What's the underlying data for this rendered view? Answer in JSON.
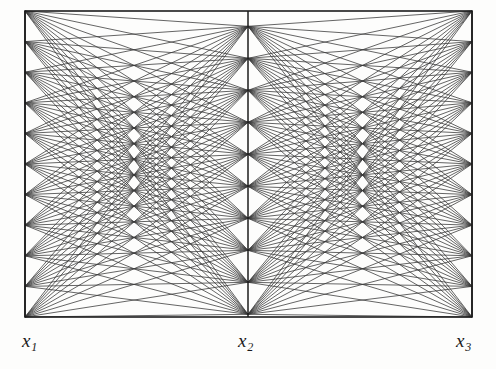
{
  "figure": {
    "kind": "parallel-coordinates-bipartite-line-figure",
    "background_color": "#fdfdfc",
    "line_color": "#3a3a3a",
    "frame_color": "#1c1c1c",
    "axis_color": "#1c1c1c"
  },
  "axes": [
    {
      "id": "x1",
      "label": "x",
      "subscript": "1",
      "x": 25,
      "label_x": 22,
      "label_y": 331,
      "node_count": 11
    },
    {
      "id": "x2",
      "label": "x",
      "subscript": "2",
      "x": 248,
      "label_x": 238,
      "label_y": 331,
      "node_count": 10
    },
    {
      "id": "x3",
      "label": "x",
      "subscript": "3",
      "x": 472,
      "label_x": 456,
      "label_y": 331,
      "node_count": 11
    }
  ],
  "frame": {
    "left": 25,
    "right": 472,
    "top": 11,
    "bottom": 317,
    "stroke_width": 1.6
  },
  "chart_data": {
    "type": "line",
    "title": "",
    "subtitle": "",
    "xlabel": "",
    "ylabel": "",
    "grid": false,
    "legend": "none",
    "axis_names": [
      "x1",
      "x2",
      "x3"
    ],
    "axis_tick_labels": [
      [],
      [],
      []
    ],
    "xlim": [
      25,
      472
    ],
    "ylim": [
      11,
      317
    ],
    "node_positions": {
      "x1": [
        11,
        41.6,
        72.2,
        102.8,
        133.4,
        164,
        194.6,
        225.2,
        255.8,
        286.4,
        317
      ],
      "x2": [
        26.3,
        58.3,
        90.3,
        122.3,
        154.3,
        186.3,
        218.3,
        250.3,
        282.3,
        314.3
      ],
      "x3": [
        11,
        41.6,
        72.2,
        102.8,
        133.4,
        164,
        194.6,
        225.2,
        255.8,
        286.4,
        317
      ]
    },
    "series": [
      {
        "name": "x1-to-x2 bundle",
        "from_axis": "x1",
        "to_axis": "x2",
        "segment_count": 110
      },
      {
        "name": "x2-to-x3 bundle",
        "from_axis": "x2",
        "to_axis": "x3",
        "segment_count": 110
      }
    ],
    "total_segments": 220
  },
  "labels": {
    "x1": {
      "base": "x",
      "sub": "1"
    },
    "x2": {
      "base": "x",
      "sub": "2"
    },
    "x3": {
      "base": "x",
      "sub": "3"
    }
  }
}
